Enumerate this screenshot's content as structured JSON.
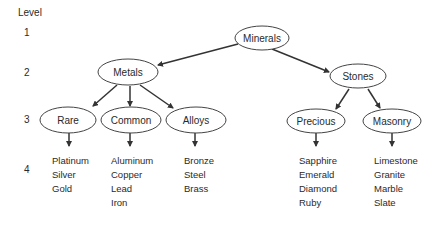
{
  "level_header": "Level",
  "levels": [
    "1",
    "2",
    "3",
    "4"
  ],
  "nodes": {
    "root": "Minerals",
    "metals": "Metals",
    "stones": "Stones",
    "rare": "Rare",
    "common": "Common",
    "alloys": "Alloys",
    "precious": "Precious",
    "masonry": "Masonry"
  },
  "leaves": {
    "rare": [
      "Platinum",
      "Silver",
      "Gold"
    ],
    "common": [
      "Aluminum",
      "Copper",
      "Lead",
      "Iron"
    ],
    "alloys": [
      "Bronze",
      "Steel",
      "Brass"
    ],
    "precious": [
      "Sapphire",
      "Emerald",
      "Diamond",
      "Ruby"
    ],
    "masonry": [
      "Limestone",
      "Granite",
      "Marble",
      "Slate"
    ]
  }
}
